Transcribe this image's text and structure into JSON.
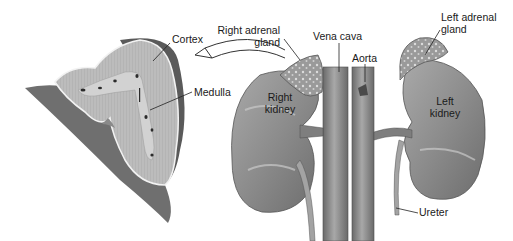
{
  "diagram": {
    "labels": {
      "cortex": "Cortex",
      "medulla": "Medulla",
      "right_adrenal_line1": "Right adrenal",
      "right_adrenal_line2": "gland",
      "vena_cava": "Vena cava",
      "aorta": "Aorta",
      "left_adrenal_line1": "Left adrenal",
      "left_adrenal_line2": "gland",
      "right_kidney_line1": "Right",
      "right_kidney_line2": "kidney",
      "left_kidney_line1": "Left",
      "left_kidney_line2": "kidney",
      "ureter": "Ureter"
    },
    "colors": {
      "kidney": "#8f8f8f",
      "kidney_highlight": "#b5b5b5",
      "adrenal": "#9a9a9a",
      "adrenal_spots": "#d8d8d8",
      "vessel": "#7d7d7d",
      "cortex": "#bdbdbd",
      "medulla": "#d0d0d0",
      "capsule": "#5e5e5e",
      "leader_line": "#222222"
    }
  }
}
